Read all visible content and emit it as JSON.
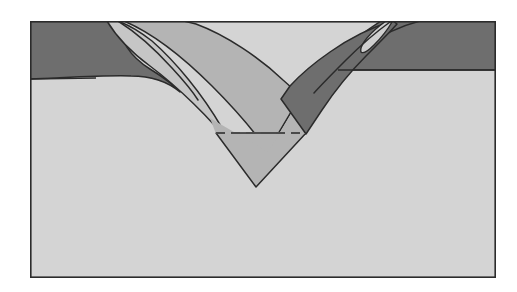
{
  "figure": {
    "kind": "geologic-cross-section",
    "caption": "",
    "canvas": {
      "width": 517,
      "height": 292
    },
    "frame": {
      "x": 30,
      "y": 21,
      "width": 466,
      "height": 257,
      "stroke_color": "#2b2b2b",
      "stroke_width": 1.6,
      "fill_color": "#d4d4d4"
    },
    "palette": {
      "background_white": "#ffffff",
      "basement_light_gray": "#d4d4d4",
      "cap_dark_gray": "#6e6e6e",
      "wedge_medium_gray": "#b4b4b4",
      "wedge_light_gray": "#c6c6c6",
      "lens_pale_gray": "#cfcfcf",
      "outline_black": "#2b2b2b",
      "dashed_line_gray": "#4a4a4a"
    },
    "units": [
      {
        "id": "basement",
        "name": "light-gray-basement",
        "fill": "#d4d4d4",
        "label": "Light gray substrate / host rock"
      },
      {
        "id": "left-cap",
        "name": "dark-gray-cap-left",
        "fill": "#6e6e6e",
        "label": "Dark gray surface layer, left flank"
      },
      {
        "id": "right-cap",
        "name": "dark-gray-cap-right",
        "fill": "#6e6e6e",
        "label": "Dark gray surface layer, right flank"
      },
      {
        "id": "left-wedge-outer",
        "name": "light-gray-wedge-outer",
        "fill": "#c6c6c6",
        "label": "Outer light gray infill band, left limb"
      },
      {
        "id": "central-wedge",
        "name": "medium-gray-central-wedge",
        "fill": "#b4b4b4",
        "label": "Central medium gray V-shaped fill"
      },
      {
        "id": "right-dark-wedge",
        "name": "dark-gray-wedge-right",
        "fill": "#6e6e6e",
        "label": "Dark gray wedge, right limb of trough"
      },
      {
        "id": "right-lens",
        "name": "pale-gray-lens",
        "fill": "#cfcfcf",
        "label": "Pale gray lens enclosed in right dark wedge"
      }
    ],
    "annotations": {
      "dashed_marker": {
        "name": "dashed-horizontal-marker",
        "x_start": 216,
        "x_end": 306,
        "y": 133,
        "dash_pattern": "9 6",
        "stroke_width": 2.2,
        "color": "#4a4a4a"
      },
      "trough_apex": {
        "x": 256,
        "y": 187
      },
      "left_surface_level_y": 79,
      "right_surface_level_y": 71
    }
  },
  "chart_data": {
    "type": "diagram",
    "title": "",
    "layers": [
      {
        "name": "Light gray basement",
        "tone": "#d4d4d4",
        "position": "entire block below surface"
      },
      {
        "name": "Dark gray cap (left)",
        "tone": "#6e6e6e",
        "position": "top-left, 22-79 px depth"
      },
      {
        "name": "Dark gray cap (right)",
        "tone": "#6e6e6e",
        "position": "top-right, 22-71 px depth"
      },
      {
        "name": "Light gray infill band",
        "tone": "#c6c6c6",
        "position": "left limb of trough"
      },
      {
        "name": "Medium gray V fill",
        "tone": "#b4b4b4",
        "position": "trough core to apex"
      },
      {
        "name": "Dark gray wedge",
        "tone": "#6e6e6e",
        "position": "right limb of trough"
      },
      {
        "name": "Pale gray lens",
        "tone": "#cfcfcf",
        "position": "inside right dark wedge, upper"
      }
    ]
  }
}
